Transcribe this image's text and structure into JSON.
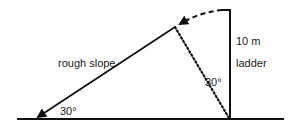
{
  "diagram": {
    "type": "geometry-figure",
    "labels": {
      "slope": "rough slope",
      "ladder_length": "10 m",
      "ladder": "ladder",
      "angle_bottom": "30°",
      "angle_top": "30°"
    },
    "colors": {
      "stroke": "#111111",
      "background": "#ffffff"
    },
    "elements": {
      "ground": {
        "x1": 17,
        "y1": 119,
        "x2": 284,
        "y2": 119
      },
      "ladder": {
        "x": 230,
        "y_top": 10,
        "y_bottom": 119,
        "top_tick_x": 222
      },
      "slope": {
        "x_top": 175,
        "y_top": 27,
        "x_bottom": 36,
        "y_bottom": 118
      },
      "dotted_radius": {
        "x1": 175,
        "y1": 27,
        "x2": 229,
        "y2": 118
      },
      "dashed_arc": {
        "from_x": 222,
        "from_y": 10,
        "to_x": 178,
        "to_y": 25
      }
    }
  }
}
